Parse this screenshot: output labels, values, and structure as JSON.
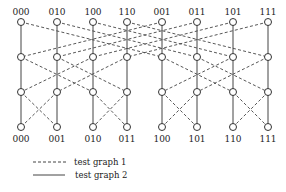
{
  "diagram": {
    "type": "butterfly-network",
    "columns_x": [
      21,
      57,
      93,
      127,
      162,
      197,
      233,
      268
    ],
    "rows_y": [
      22,
      57,
      92,
      127
    ],
    "top_labels": [
      "000",
      "010",
      "100",
      "110",
      "001",
      "011",
      "101",
      "111"
    ],
    "bottom_labels": [
      "000",
      "001",
      "010",
      "011",
      "100",
      "101",
      "110",
      "111"
    ],
    "stages": [
      {
        "from_row": 0,
        "to_row": 1,
        "dashed_pairs": [
          [
            0,
            4
          ],
          [
            1,
            5
          ],
          [
            2,
            6
          ],
          [
            3,
            7
          ],
          [
            4,
            0
          ],
          [
            5,
            1
          ],
          [
            6,
            2
          ],
          [
            7,
            3
          ]
        ]
      },
      {
        "from_row": 1,
        "to_row": 2,
        "dashed_pairs": [
          [
            0,
            2
          ],
          [
            1,
            3
          ],
          [
            2,
            0
          ],
          [
            3,
            1
          ],
          [
            4,
            6
          ],
          [
            5,
            7
          ],
          [
            6,
            4
          ],
          [
            7,
            5
          ]
        ]
      },
      {
        "from_row": 2,
        "to_row": 3,
        "dashed_pairs": [
          [
            0,
            1
          ],
          [
            1,
            0
          ],
          [
            2,
            3
          ],
          [
            3,
            2
          ],
          [
            4,
            5
          ],
          [
            5,
            4
          ],
          [
            6,
            7
          ],
          [
            7,
            6
          ]
        ]
      }
    ],
    "solid_verticals": [
      0,
      1,
      2,
      3,
      4,
      5,
      6,
      7
    ],
    "node_radius": 3.5,
    "colors": {
      "line": "#444444",
      "node": "#333333",
      "background": "#ffffff"
    }
  },
  "legend": {
    "items": [
      {
        "style": "dashed",
        "label": "test graph 1"
      },
      {
        "style": "solid",
        "label": "test graph 2"
      }
    ]
  }
}
